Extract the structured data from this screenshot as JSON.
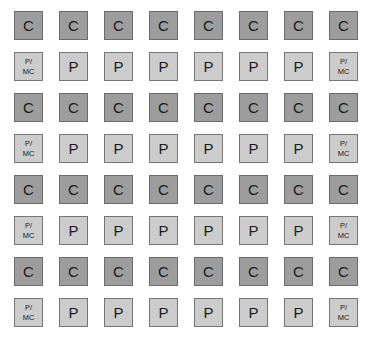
{
  "diagram": {
    "background_color": "#ffffff",
    "rows": 8,
    "columns": 8,
    "cell_types": {
      "C": {
        "label": "C",
        "fill_color": "#9d9d9d",
        "border_color": "#6b6b6b",
        "text_color": "#1a1a1a"
      },
      "P": {
        "label": "P",
        "fill_color": "#cccccc",
        "border_color": "#767676",
        "text_color": "#1a1a1a"
      },
      "P/MC": {
        "label_line1": "P/",
        "label_line2": "MC",
        "fill_color": "#cccccc",
        "border_color": "#767676",
        "text_color": "#1a1a1a"
      }
    },
    "grid": [
      [
        "C",
        "C",
        "C",
        "C",
        "C",
        "C",
        "C",
        "C"
      ],
      [
        "P/MC",
        "P",
        "P",
        "P",
        "P",
        "P",
        "P",
        "P/MC"
      ],
      [
        "C",
        "C",
        "C",
        "C",
        "C",
        "C",
        "C",
        "C"
      ],
      [
        "P/MC",
        "P",
        "P",
        "P",
        "P",
        "P",
        "P",
        "P/MC"
      ],
      [
        "C",
        "C",
        "C",
        "C",
        "C",
        "C",
        "C",
        "C"
      ],
      [
        "P/MC",
        "P",
        "P",
        "P",
        "P",
        "P",
        "P",
        "P/MC"
      ],
      [
        "C",
        "C",
        "C",
        "C",
        "C",
        "C",
        "C",
        "C"
      ],
      [
        "P/MC",
        "P",
        "P",
        "P",
        "P",
        "P",
        "P",
        "P/MC"
      ]
    ],
    "layout": {
      "cell_width": 29,
      "cell_height": 29,
      "column_pitch": 45,
      "row_pitch": 41,
      "origin_x": 14,
      "origin_y": 11
    }
  }
}
